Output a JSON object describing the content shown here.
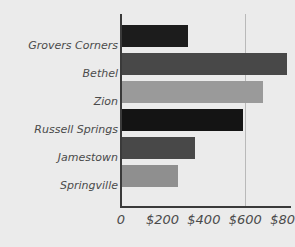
{
  "chart_data": {
    "type": "bar",
    "orientation": "horizontal",
    "title": "",
    "subtitle": "",
    "xlabel": "",
    "ylabel": "",
    "categories": [
      "Grovers Corners",
      "Bethel",
      "Zion",
      "Russell Springs",
      "Jamestown",
      "Springville"
    ],
    "values": [
      325,
      800,
      685,
      590,
      355,
      275
    ],
    "bar_colors": [
      "#1c1c1c",
      "#484848",
      "#9a9a9a",
      "#141414",
      "#484848",
      "#8f8f8f"
    ],
    "xlim": [
      0,
      840
    ],
    "ticks": [
      0,
      200,
      400,
      600,
      800
    ],
    "tick_labels": [
      "0",
      "$200",
      "$400",
      "$600",
      "$800"
    ],
    "gridlines": [
      600
    ],
    "grid": true,
    "legend": "none",
    "axis_color": "#3a3a3a",
    "gridline_color": "#b9b9b9",
    "background_color": "#ebebeb",
    "label_color": "#4a4a4a"
  }
}
